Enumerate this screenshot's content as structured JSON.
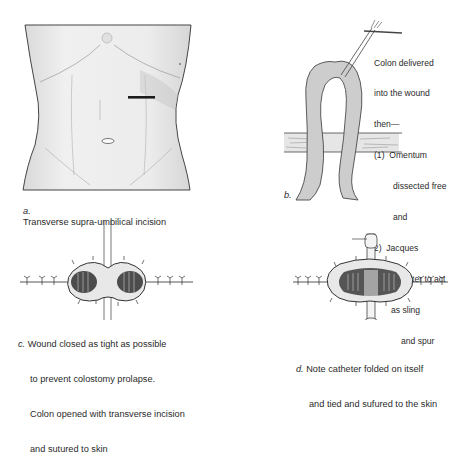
{
  "figure": {
    "panels": [
      {
        "id": "a",
        "label": "a.",
        "caption": "Transverse supra-umbilical incision"
      },
      {
        "id": "b",
        "label": "b.",
        "annotation": {
          "lines": [
            "Colon delivered",
            "into the wound",
            "then—",
            "(1)  Omentum",
            "dissected free",
            "and",
            "(2)  Jacques",
            "catheter to act",
            "as sling",
            "and spur"
          ]
        }
      },
      {
        "id": "c",
        "label": "c.",
        "caption_lines": [
          "Wound closed as tight as possible",
          "to prevent colostomy prolapse.",
          "Colon opened with transverse incision",
          "and sutured to skin"
        ]
      },
      {
        "id": "d",
        "label": "d.",
        "caption_lines": [
          "Note catheter folded on itself",
          "and tied and sufured to the skin"
        ]
      }
    ],
    "colors": {
      "ink": "#2a2a2a",
      "skin": "#e8e8e8",
      "bowel": "#c8c8c8",
      "mucosa": "#555555"
    }
  }
}
